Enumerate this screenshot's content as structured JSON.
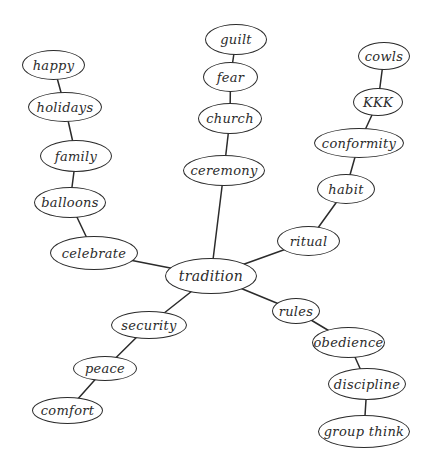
{
  "diagram": {
    "type": "mind-map",
    "center": "tradition",
    "colors": {
      "stroke": "#2b2b2b",
      "background": "#ffffff",
      "text": "#2b2b2b"
    },
    "nodes": [
      {
        "id": "tradition",
        "label": "tradition",
        "x": 165,
        "y": 258,
        "w": 92,
        "h": 36
      },
      {
        "id": "celebrate",
        "label": "celebrate",
        "x": 50,
        "y": 236,
        "w": 88,
        "h": 34
      },
      {
        "id": "balloons",
        "label": "balloons",
        "x": 34,
        "y": 187,
        "w": 72,
        "h": 31
      },
      {
        "id": "family",
        "label": "family",
        "x": 40,
        "y": 140,
        "w": 72,
        "h": 32
      },
      {
        "id": "holidays",
        "label": "holidays",
        "x": 28,
        "y": 92,
        "w": 74,
        "h": 30
      },
      {
        "id": "happy",
        "label": "happy",
        "x": 22,
        "y": 50,
        "w": 63,
        "h": 30
      },
      {
        "id": "ceremony",
        "label": "ceremony",
        "x": 183,
        "y": 155,
        "w": 82,
        "h": 31
      },
      {
        "id": "church",
        "label": "church",
        "x": 198,
        "y": 103,
        "w": 64,
        "h": 31
      },
      {
        "id": "fear",
        "label": "fear",
        "x": 203,
        "y": 62,
        "w": 55,
        "h": 30
      },
      {
        "id": "guilt",
        "label": "guilt",
        "x": 205,
        "y": 24,
        "w": 62,
        "h": 31
      },
      {
        "id": "ritual",
        "label": "ritual",
        "x": 277,
        "y": 226,
        "w": 63,
        "h": 30
      },
      {
        "id": "habit",
        "label": "habit",
        "x": 317,
        "y": 174,
        "w": 58,
        "h": 30
      },
      {
        "id": "conformity",
        "label": "conformity",
        "x": 314,
        "y": 128,
        "w": 90,
        "h": 30
      },
      {
        "id": "kkk",
        "label": "KKK",
        "x": 353,
        "y": 88,
        "w": 50,
        "h": 28
      },
      {
        "id": "cowls",
        "label": "cowls",
        "x": 358,
        "y": 42,
        "w": 52,
        "h": 28
      },
      {
        "id": "rules",
        "label": "rules",
        "x": 272,
        "y": 298,
        "w": 48,
        "h": 26
      },
      {
        "id": "obedience",
        "label": "obedience",
        "x": 312,
        "y": 327,
        "w": 73,
        "h": 31
      },
      {
        "id": "discipline",
        "label": "discipline",
        "x": 328,
        "y": 368,
        "w": 78,
        "h": 32
      },
      {
        "id": "group_think",
        "label": "group think",
        "x": 318,
        "y": 415,
        "w": 92,
        "h": 33
      },
      {
        "id": "security",
        "label": "security",
        "x": 111,
        "y": 311,
        "w": 76,
        "h": 28
      },
      {
        "id": "peace",
        "label": "peace",
        "x": 73,
        "y": 356,
        "w": 64,
        "h": 25
      },
      {
        "id": "comfort",
        "label": "comfort",
        "x": 32,
        "y": 397,
        "w": 71,
        "h": 27
      }
    ],
    "edges": [
      [
        "tradition",
        "celebrate"
      ],
      [
        "celebrate",
        "balloons"
      ],
      [
        "balloons",
        "family"
      ],
      [
        "family",
        "holidays"
      ],
      [
        "holidays",
        "happy"
      ],
      [
        "tradition",
        "ceremony"
      ],
      [
        "ceremony",
        "church"
      ],
      [
        "church",
        "fear"
      ],
      [
        "fear",
        "guilt"
      ],
      [
        "tradition",
        "ritual"
      ],
      [
        "ritual",
        "habit"
      ],
      [
        "habit",
        "conformity"
      ],
      [
        "conformity",
        "kkk"
      ],
      [
        "kkk",
        "cowls"
      ],
      [
        "tradition",
        "rules"
      ],
      [
        "rules",
        "obedience"
      ],
      [
        "obedience",
        "discipline"
      ],
      [
        "discipline",
        "group_think"
      ],
      [
        "tradition",
        "security"
      ],
      [
        "security",
        "peace"
      ],
      [
        "peace",
        "comfort"
      ]
    ]
  }
}
